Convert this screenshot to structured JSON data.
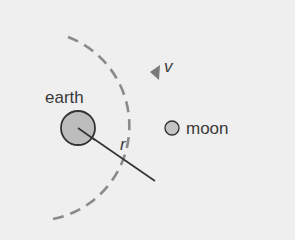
{
  "diagram": {
    "labels": {
      "earth": "earth",
      "moon": "moon",
      "radius": "r",
      "velocity": "v"
    },
    "colors": {
      "background": "#efefef",
      "orbit": "#8a8a8a",
      "body_fill": "#bdbdbd",
      "stroke": "#333333",
      "text": "#3a3a3a"
    }
  }
}
